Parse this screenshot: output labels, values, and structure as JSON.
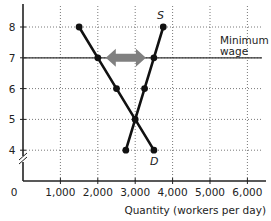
{
  "chart_data": {
    "type": "line",
    "title": "",
    "xlabel": "Quantity (workers per day)",
    "ylabel": "",
    "xlim": [
      0,
      6500
    ],
    "ylim": [
      3,
      8.7
    ],
    "grid": true,
    "x_ticks": [
      {
        "value": 0,
        "label": "0"
      },
      {
        "value": 1000,
        "label": "1,000"
      },
      {
        "value": 2000,
        "label": "2,000"
      },
      {
        "value": 3000,
        "label": "3,000"
      },
      {
        "value": 4000,
        "label": "4,000"
      },
      {
        "value": 5000,
        "label": "5,000"
      },
      {
        "value": 6000,
        "label": "6,000"
      }
    ],
    "y_ticks": [
      {
        "value": 4,
        "label": "4"
      },
      {
        "value": 5,
        "label": "5"
      },
      {
        "value": 6,
        "label": "6"
      },
      {
        "value": 7,
        "label": "7"
      },
      {
        "value": 8,
        "label": "8"
      }
    ],
    "series": [
      {
        "name": "D",
        "label": "D",
        "points": [
          [
            1500,
            8
          ],
          [
            2000,
            7
          ],
          [
            2500,
            6
          ],
          [
            3000,
            5
          ],
          [
            3500,
            4
          ]
        ]
      },
      {
        "name": "S",
        "label": "S",
        "points": [
          [
            2750,
            4
          ],
          [
            3000,
            5
          ],
          [
            3250,
            6
          ],
          [
            3500,
            7
          ],
          [
            3750,
            8
          ]
        ]
      }
    ],
    "hlines": [
      {
        "y": 7,
        "label": "Minimum wage",
        "label_lines": [
          "Minimum",
          "wage"
        ]
      }
    ],
    "annotations": [
      {
        "type": "double-arrow",
        "from": [
          2000,
          7
        ],
        "to": [
          3500,
          7
        ],
        "meaning": "unemployment (surplus of labor)",
        "color": "#808080"
      }
    ],
    "axis_break": "y"
  }
}
